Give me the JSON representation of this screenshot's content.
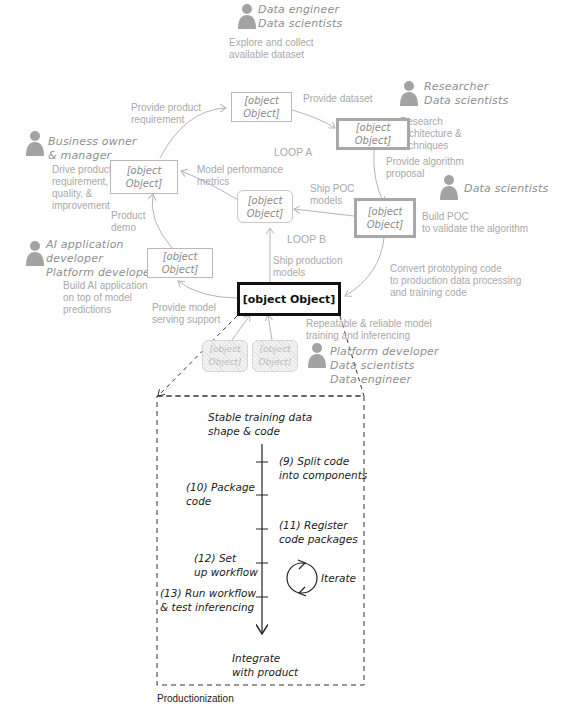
{
  "diagram": {
    "title_caption": "Productionization",
    "colors": {
      "muted_text": "#a9a9a9",
      "role_text": "#8f8f8f",
      "person_icon": "#a3a3a3",
      "highlight_border": "#111111",
      "thick_box_border": "#a8a8a8"
    },
    "nodes": {
      "product_management": {
        "label": "(1) Product\nmanagement"
      },
      "data_exploration": {
        "label": "(2) Data\nexploration"
      },
      "dl_research": {
        "label": "(3) DL\nresearch"
      },
      "prototyping": {
        "label": "(4)\nPrototyping"
      },
      "productionization": {
        "label": "(5)\nProductionization"
      },
      "product_integration": {
        "label": "(6) Product\nintegration"
      },
      "model": {
        "label": "Model"
      },
      "mlops": {
        "label": "MLOps"
      },
      "dl_systems": {
        "label": "DL\nsystems"
      }
    },
    "roles": {
      "data_exploration": "Data engineer\nData scientists",
      "dl_research": "Researcher\nData scientists",
      "prototyping": "Data scientists",
      "product_management": "Business owner\n& manager",
      "product_integration": "AI application\ndeveloper\nPlatform developer",
      "productionization": "Platform developer\nData scientists\nData engineer"
    },
    "descriptions": {
      "data_exploration": "Explore and collect\navailable dataset",
      "dl_research": "Research\narchitecture &\ntechniques",
      "prototyping": "Build POC\nto validate the algorithm",
      "product_management": "Drive product\nrequirement,\nquality, &\nimprovement",
      "product_integration": "Build AI application\non top of model\npredictions",
      "productionization": "Repeatable & reliable model\ntraining and inferencing"
    },
    "edges": {
      "provide_product_requirement": "Provide product\nrequirement",
      "provide_dataset": "Provide dataset",
      "provide_algorithm_proposal": "Provide algorithm\nproposal",
      "ship_poc_models": "Ship POC\nmodels",
      "model_performance_metrics": "Model performance\nmetrics",
      "product_demo": "Product\ndemo",
      "ship_production_models": "Ship production\nmodels",
      "convert_prototyping_code": "Convert prototyping code\nto production data processing\nand training code",
      "provide_model_serving_support": "Provide model\nserving support"
    },
    "loops": {
      "loop_a": "LOOP A",
      "loop_b": "LOOP B"
    },
    "detail": {
      "start": "Stable training data\nshape & code",
      "steps": [
        {
          "label": "(9) Split code\ninto components",
          "side": "right"
        },
        {
          "label": "(10) Package\ncode",
          "side": "left"
        },
        {
          "label": "(11) Register\ncode packages",
          "side": "right"
        },
        {
          "label": "(12) Set\nup workflow",
          "side": "left"
        },
        {
          "label": "(13) Run workflow\n& test inferencing",
          "side": "left"
        }
      ],
      "iterate": "Iterate",
      "end": "Integrate\nwith product"
    }
  }
}
